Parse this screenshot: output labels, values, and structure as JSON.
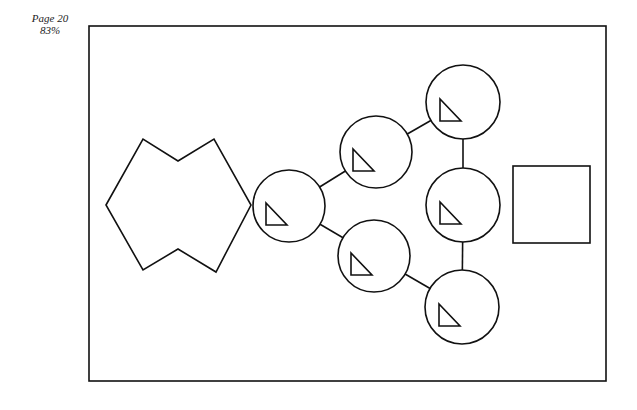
{
  "page_label": {
    "page": "Page 20",
    "zoom": "83%"
  },
  "diagram": {
    "frame": {
      "x": 89,
      "y": 26,
      "w": 517,
      "h": 355
    },
    "star": {
      "points": "106,205 143,139 178,161 214,139 251,205 216,272 178,249 143,270"
    },
    "nodes": [
      {
        "id": "c1",
        "cx": 289,
        "cy": 206,
        "r": 36
      },
      {
        "id": "c2",
        "cx": 376,
        "cy": 152,
        "r": 36
      },
      {
        "id": "c3",
        "cx": 374,
        "cy": 256,
        "r": 36
      },
      {
        "id": "c4",
        "cx": 463,
        "cy": 102,
        "r": 37
      },
      {
        "id": "c5",
        "cx": 463,
        "cy": 205,
        "r": 37
      },
      {
        "id": "c6",
        "cx": 462,
        "cy": 307,
        "r": 37
      }
    ],
    "edges": [
      [
        "c1",
        "c2"
      ],
      [
        "c1",
        "c3"
      ],
      [
        "c2",
        "c4"
      ],
      [
        "c3",
        "c6"
      ],
      [
        "c4",
        "c5"
      ],
      [
        "c5",
        "c6"
      ]
    ],
    "square": {
      "x": 513,
      "y": 166,
      "w": 77,
      "h": 77
    }
  }
}
